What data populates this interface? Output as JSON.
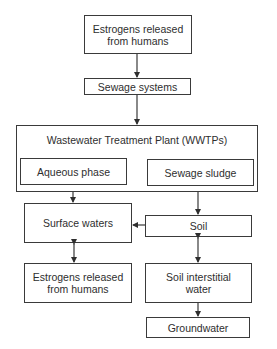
{
  "diagram": {
    "nodes": {
      "source_top": {
        "label_line1": "Estrogens released",
        "label_line2": "from humans"
      },
      "sewage_systems": {
        "label": "Sewage systems"
      },
      "wwtp": {
        "title": "Wastewater Treatment Plant (WWTPs)",
        "aqueous_phase": {
          "label": "Aqueous phase"
        },
        "sewage_sludge": {
          "label": "Sewage sludge"
        }
      },
      "surface_waters": {
        "label": "Surface waters"
      },
      "soil": {
        "label": "Soil"
      },
      "source_bottom": {
        "label_line1": "Estrogens released",
        "label_line2": "from humans"
      },
      "soil_interstitial_water": {
        "label_line1": "Soil interstitial",
        "label_line2": "water"
      },
      "groundwater": {
        "label": "Groundwater"
      }
    },
    "edges": [
      {
        "from": "Estrogens released from humans",
        "to": "Sewage systems",
        "type": "one-way"
      },
      {
        "from": "Sewage systems",
        "to": "Wastewater Treatment Plant (WWTPs)",
        "type": "one-way"
      },
      {
        "from": "Aqueous phase",
        "to": "Surface waters",
        "type": "one-way"
      },
      {
        "from": "Sewage sludge",
        "to": "Soil",
        "type": "one-way"
      },
      {
        "from": "Soil",
        "to": "Surface waters",
        "type": "one-way"
      },
      {
        "from": "Surface waters",
        "to": "Estrogens released from humans",
        "type": "two-way"
      },
      {
        "from": "Soil",
        "to": "Soil interstitial water",
        "type": "two-way"
      },
      {
        "from": "Soil interstitial water",
        "to": "Groundwater",
        "type": "one-way"
      }
    ],
    "colors": {
      "stroke": "#3a3a3a",
      "background": "#ffffff",
      "text": "#2e2e2e"
    }
  }
}
